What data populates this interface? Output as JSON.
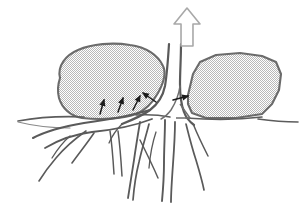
{
  "figure": {
    "title": "Tree root wedging rock fragments apart",
    "type": "line-drawing",
    "background_color": "#ffffff",
    "canvas": {
      "width": 305,
      "height": 208
    }
  },
  "palette": {
    "outline_dark": "#4a4a4a",
    "outline_medium": "#6e6e6e",
    "outline_light": "#9a9a9a",
    "boulder_fill": "#d7d7d7",
    "boulder_stroke": "#6b6b6b",
    "arrow_hollow_stroke": "#a8a8a8",
    "arrow_solid": "#1a1a1a",
    "ground_line": "#5c5c5c",
    "root_stroke": "#5a5a5a"
  },
  "elements": {
    "growth_arrow": {
      "name": "hollow-up-arrow",
      "label": "",
      "direction": "up",
      "style": "outlined",
      "x": 174,
      "y": 8,
      "width": 26,
      "height": 38
    },
    "trunk": {
      "name": "tree-trunk",
      "label": "",
      "top_x": 176,
      "top_y": 40,
      "base_y": 128
    },
    "left_boulder": {
      "name": "left-boulder",
      "label": "",
      "shape": "rounded-blob",
      "fill": "#d7d7d7",
      "stroke": "#6b6b6b"
    },
    "right_boulder": {
      "name": "right-boulder",
      "label": "",
      "shape": "angular-polygon",
      "fill": "#d7d7d7",
      "stroke": "#6b6b6b"
    },
    "ground_line": {
      "name": "ground-surface-line",
      "label": ""
    },
    "root_system": {
      "name": "root-system",
      "label": "",
      "branch_count": 7
    }
  },
  "pressure_arrows": [
    {
      "name": "pressure-arrow-1",
      "x1": 100,
      "y1": 114,
      "x2": 104,
      "y2": 100,
      "label": ""
    },
    {
      "name": "pressure-arrow-2",
      "x1": 118,
      "y1": 112,
      "x2": 123,
      "y2": 98,
      "label": ""
    },
    {
      "name": "pressure-arrow-3",
      "x1": 133,
      "y1": 110,
      "x2": 140,
      "y2": 96,
      "label": ""
    },
    {
      "name": "pressure-arrow-4",
      "x1": 156,
      "y1": 102,
      "x2": 143,
      "y2": 93,
      "label": ""
    },
    {
      "name": "pressure-arrow-5",
      "x1": 173,
      "y1": 100,
      "x2": 188,
      "y2": 96,
      "label": ""
    }
  ],
  "annotations": {
    "visible_text": []
  }
}
